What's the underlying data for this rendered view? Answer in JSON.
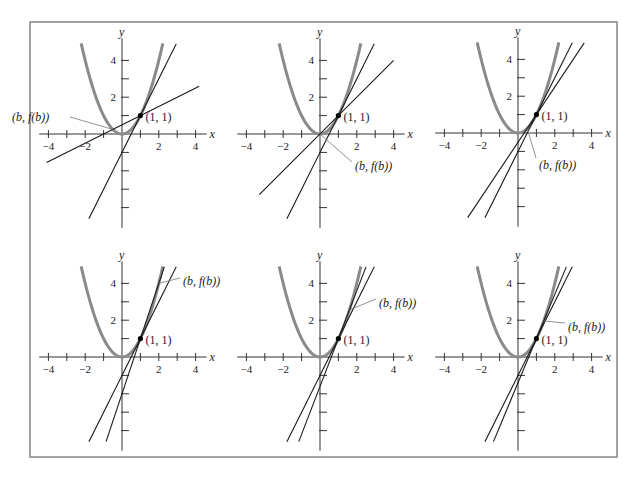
{
  "figure": {
    "frame_color": "#8c8c8c",
    "curve_color": "#8a8a8a",
    "line_color": "#1a1a1a",
    "axis_color": "#333333",
    "point_label": "(1, 1)",
    "secant_label": "(b, f(b))",
    "x_axis_label": "x",
    "y_axis_label": "y",
    "x_tick_labels": [
      "−4",
      "−2",
      "2",
      "4"
    ],
    "y_tick_labels": [
      "2",
      "4"
    ]
  },
  "chart_data": [
    {
      "type": "line",
      "title": "Panel 1",
      "function": "y = x^2",
      "point": [
        1,
        1
      ],
      "b": -0.5,
      "series": [
        {
          "name": "f(x) = x^2",
          "x": [
            -2.2,
            2.2
          ]
        },
        {
          "name": "secant through (b, f(b)) and (1,1)",
          "slope": 0.5,
          "intercept": 0.5
        },
        {
          "name": "tangent at (1,1)",
          "slope": 2,
          "intercept": -1
        }
      ],
      "xlim": [
        -4.5,
        4.5
      ],
      "ylim": [
        -5,
        5
      ],
      "xticks": [
        -4,
        -3,
        -2,
        -1,
        1,
        2,
        3,
        4
      ],
      "yticks": [
        -4,
        -3,
        -2,
        -1,
        1,
        2,
        3,
        4
      ],
      "xlabel": "x",
      "ylabel": "y",
      "annotations": [
        "(b, f(b))",
        "(1, 1)"
      ]
    },
    {
      "type": "line",
      "title": "Panel 2",
      "function": "y = x^2",
      "point": [
        1,
        1
      ],
      "b": 0,
      "series": [
        {
          "name": "f(x) = x^2",
          "x": [
            -2.2,
            2.2
          ]
        },
        {
          "name": "secant",
          "slope": 1,
          "intercept": 0
        },
        {
          "name": "tangent at (1,1)",
          "slope": 2,
          "intercept": -1
        }
      ],
      "xlim": [
        -4.5,
        4.5
      ],
      "ylim": [
        -5,
        5
      ],
      "xlabel": "x",
      "ylabel": "y",
      "annotations": [
        "(b, f(b))",
        "(1, 1)"
      ]
    },
    {
      "type": "line",
      "title": "Panel 3",
      "function": "y = x^2",
      "point": [
        1,
        1
      ],
      "b": 0.5,
      "series": [
        {
          "name": "f(x) = x^2",
          "x": [
            -2.2,
            2.2
          ]
        },
        {
          "name": "secant",
          "slope": 1.5,
          "intercept": -0.5
        },
        {
          "name": "tangent at (1,1)",
          "slope": 2,
          "intercept": -1
        }
      ],
      "xlim": [
        -4.5,
        4.5
      ],
      "ylim": [
        -5,
        5
      ],
      "xlabel": "x",
      "ylabel": "y",
      "annotations": [
        "(b, f(b))",
        "(1, 1)"
      ]
    },
    {
      "type": "line",
      "title": "Panel 4",
      "function": "y = x^2",
      "point": [
        1,
        1
      ],
      "b": 2,
      "series": [
        {
          "name": "f(x) = x^2",
          "x": [
            -2.2,
            2.2
          ]
        },
        {
          "name": "secant",
          "slope": 3,
          "intercept": -2
        },
        {
          "name": "tangent at (1,1)",
          "slope": 2,
          "intercept": -1
        }
      ],
      "xlim": [
        -4.5,
        4.5
      ],
      "ylim": [
        -5,
        5
      ],
      "xlabel": "x",
      "ylabel": "y",
      "annotations": [
        "(b, f(b))",
        "(1, 1)"
      ]
    },
    {
      "type": "line",
      "title": "Panel 5",
      "function": "y = x^2",
      "point": [
        1,
        1
      ],
      "b": 1.6,
      "series": [
        {
          "name": "f(x) = x^2",
          "x": [
            -2.2,
            2.2
          ]
        },
        {
          "name": "secant",
          "slope": 2.6,
          "intercept": -1.6
        },
        {
          "name": "tangent at (1,1)",
          "slope": 2,
          "intercept": -1
        }
      ],
      "xlim": [
        -4.5,
        4.5
      ],
      "ylim": [
        -5,
        5
      ],
      "xlabel": "x",
      "ylabel": "y",
      "annotations": [
        "(b, f(b))",
        "(1, 1)"
      ]
    },
    {
      "type": "line",
      "title": "Panel 6",
      "function": "y = x^2",
      "point": [
        1,
        1
      ],
      "b": 1.4,
      "series": [
        {
          "name": "f(x) = x^2",
          "x": [
            -2.2,
            2.2
          ]
        },
        {
          "name": "secant",
          "slope": 2.4,
          "intercept": -1.4
        },
        {
          "name": "tangent at (1,1)",
          "slope": 2,
          "intercept": -1
        }
      ],
      "xlim": [
        -4.5,
        4.5
      ],
      "ylim": [
        -5,
        5
      ],
      "xlabel": "x",
      "ylabel": "y",
      "annotations": [
        "(b, f(b))",
        "(1, 1)"
      ]
    }
  ],
  "layout": {
    "frame": {
      "x": 30,
      "y": 22,
      "w": 587,
      "h": 435
    },
    "scale": 18.4,
    "origins": [
      [
        122,
        134
      ],
      [
        320,
        134
      ],
      [
        518,
        133
      ],
      [
        122,
        357
      ],
      [
        320,
        357
      ],
      [
        518,
        357
      ]
    ],
    "label_pos": [
      {
        "lx": 12,
        "ly": 117,
        "anchor": "start",
        "tx": -0.5,
        "leader_end": [
          70,
          117
        ]
      },
      {
        "lx": 355,
        "ly": 166,
        "anchor": "start",
        "tx": 0,
        "leader_end": [
          352,
          162
        ]
      },
      {
        "lx": 539,
        "ly": 165,
        "anchor": "start",
        "tx": 0.5,
        "leader_end": [
          536,
          158
        ]
      },
      {
        "lx": 183,
        "ly": 281,
        "anchor": "start",
        "tx": 2,
        "leader_end": [
          180,
          278
        ]
      },
      {
        "lx": 379,
        "ly": 303,
        "anchor": "start",
        "tx": 1.6,
        "leader_end": [
          376,
          299
        ]
      },
      {
        "lx": 568,
        "ly": 327,
        "anchor": "start",
        "tx": 1.4,
        "leader_end": [
          565,
          323
        ]
      }
    ]
  }
}
